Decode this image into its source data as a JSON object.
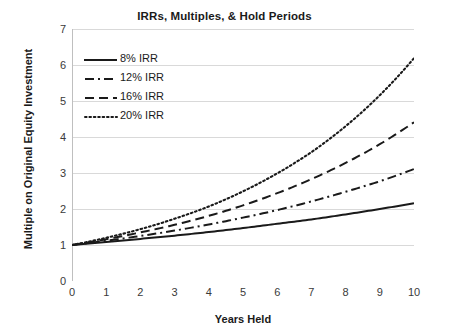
{
  "chart_data": {
    "type": "line",
    "title": "IRRs, Multiples, & Hold Periods",
    "xlabel": "Years Held",
    "ylabel": "Multiple on Original Equity Investment",
    "xlim": [
      0,
      10
    ],
    "ylim": [
      0,
      7
    ],
    "x_ticks": [
      "0",
      "1",
      "2",
      "3",
      "4",
      "5",
      "6",
      "7",
      "8",
      "9",
      "10"
    ],
    "y_ticks": [
      "0",
      "1",
      "2",
      "3",
      "4",
      "5",
      "6",
      "7"
    ],
    "grid": "horizontal",
    "legend_position": "upper-left-inside",
    "line_color": "#1a1a1a",
    "grid_color": "#d9d9d9",
    "axis_color": "#bfbfbf",
    "x": [
      0,
      1,
      2,
      3,
      4,
      5,
      6,
      7,
      8,
      9,
      10
    ],
    "series": [
      {
        "name": "8% IRR",
        "style": "solid",
        "values": [
          1.0,
          1.08,
          1.17,
          1.26,
          1.36,
          1.47,
          1.59,
          1.71,
          1.85,
          2.0,
          2.16
        ]
      },
      {
        "name": "12% IRR",
        "style": "dash-dot",
        "values": [
          1.0,
          1.12,
          1.25,
          1.4,
          1.57,
          1.76,
          1.97,
          2.21,
          2.48,
          2.77,
          3.11
        ]
      },
      {
        "name": "16% IRR",
        "style": "dashed",
        "values": [
          1.0,
          1.16,
          1.35,
          1.56,
          1.81,
          2.1,
          2.44,
          2.83,
          3.28,
          3.8,
          4.41
        ]
      },
      {
        "name": "20% IRR",
        "style": "dotted",
        "values": [
          1.0,
          1.2,
          1.44,
          1.73,
          2.07,
          2.49,
          2.99,
          3.58,
          4.3,
          5.16,
          6.19
        ]
      }
    ]
  },
  "legend": {
    "items": [
      {
        "label": "8% IRR",
        "style": "solid"
      },
      {
        "label": "12% IRR",
        "style": "dash-dot"
      },
      {
        "label": "16% IRR",
        "style": "dashed"
      },
      {
        "label": "20% IRR",
        "style": "dotted"
      }
    ]
  }
}
